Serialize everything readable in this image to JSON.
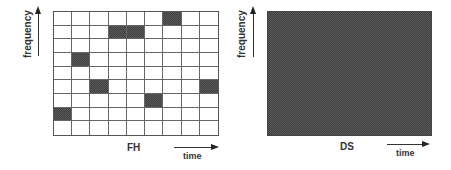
{
  "fh_panel": {
    "y_axis_label": "frequency",
    "x_axis_label": "time",
    "title": "FH",
    "grid": {
      "rows": 9,
      "cols": 9,
      "active_cells": [
        {
          "row": 0,
          "col": 6
        },
        {
          "row": 1,
          "col": 3
        },
        {
          "row": 1,
          "col": 4
        },
        {
          "row": 3,
          "col": 1
        },
        {
          "row": 5,
          "col": 2
        },
        {
          "row": 5,
          "col": 8
        },
        {
          "row": 6,
          "col": 5
        },
        {
          "row": 7,
          "col": 0
        }
      ]
    }
  },
  "ds_panel": {
    "y_axis_label": "frequency",
    "x_axis_label": "time",
    "title": "DS",
    "fill": "full-band"
  },
  "colors": {
    "active_fill": "#505050",
    "grid_line": "#666666",
    "background": "#ffffff"
  }
}
